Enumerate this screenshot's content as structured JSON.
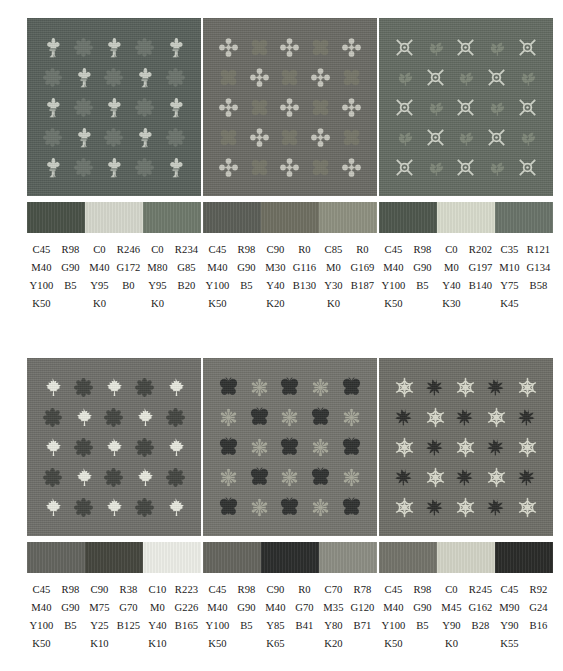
{
  "page": {
    "kind": "textile-color-swatch-sheet",
    "background": "#ffffff"
  },
  "blocks": [
    {
      "id": "block-1",
      "position": "top-left",
      "fabric": {
        "background": "#57605a",
        "motif_a": {
          "name": "fleur-de-lis-icon",
          "color": "#c9cdc4"
        },
        "motif_b": {
          "name": "flower-rosette-icon",
          "color": "#6b736c"
        }
      },
      "bar": [
        "#4a5248",
        "#d5d7cc",
        "#6f7a6c"
      ],
      "columns": [
        {
          "cmyk": [
            "C45",
            "M40",
            "Y100",
            "K50"
          ],
          "rgb": [
            "R98",
            "G90",
            "B5"
          ]
        },
        {
          "cmyk": [
            "C0",
            "M40",
            "Y95",
            "K0"
          ],
          "rgb": [
            "R246",
            "G172",
            "B0"
          ]
        },
        {
          "cmyk": [
            "C0",
            "M80",
            "Y95",
            "K0"
          ],
          "rgb": [
            "R234",
            "G85",
            "B20"
          ]
        }
      ]
    },
    {
      "id": "block-2",
      "position": "top-middle",
      "fabric": {
        "background": "#6a6a64",
        "motif_a": {
          "name": "cross-clover-icon",
          "color": "#c6c6bd"
        },
        "motif_b": {
          "name": "quatrefoil-icon",
          "color": "#757568"
        }
      },
      "bar": [
        "#5c5f58",
        "#6f6f62",
        "#8f9181"
      ],
      "columns": [
        {
          "cmyk": [
            "C45",
            "M40",
            "Y100",
            "K50"
          ],
          "rgb": [
            "R98",
            "G90",
            "B5"
          ]
        },
        {
          "cmyk": [
            "C90",
            "M30",
            "Y40",
            "K20"
          ],
          "rgb": [
            "R0",
            "G116",
            "B130"
          ]
        },
        {
          "cmyk": [
            "C85",
            "M0",
            "Y30",
            "K0"
          ],
          "rgb": [
            "R0",
            "G169",
            "B187"
          ]
        }
      ]
    },
    {
      "id": "block-3",
      "position": "top-right",
      "fabric": {
        "background": "#636b62",
        "motif_a": {
          "name": "x-in-circle-icon",
          "color": "#cfd3c8"
        },
        "motif_b": {
          "name": "leaf-sprig-icon",
          "color": "#7e8678"
        }
      },
      "bar": [
        "#4f584e",
        "#d8dbcc",
        "#6a746a"
      ],
      "columns": [
        {
          "cmyk": [
            "C45",
            "M40",
            "Y100",
            "K50"
          ],
          "rgb": [
            "R98",
            "G90",
            "B5"
          ]
        },
        {
          "cmyk": [
            "C0",
            "M0",
            "Y40",
            "K30"
          ],
          "rgb": [
            "R202",
            "G197",
            "B140"
          ]
        },
        {
          "cmyk": [
            "C35",
            "M10",
            "Y75",
            "K45"
          ],
          "rgb": [
            "R121",
            "G134",
            "B58"
          ]
        }
      ]
    },
    {
      "id": "block-4",
      "position": "bottom-left",
      "fabric": {
        "background": "#6f6f6a",
        "motif_a": {
          "name": "maple-leaf-icon",
          "color": "#e8e9df"
        },
        "motif_b": {
          "name": "flower-rosette-icon",
          "color": "#434541"
        }
      },
      "bar": [
        "#64655f",
        "#46473f",
        "#ecede7"
      ],
      "columns": [
        {
          "cmyk": [
            "C45",
            "M40",
            "Y100",
            "K50"
          ],
          "rgb": [
            "R98",
            "G90",
            "B5"
          ]
        },
        {
          "cmyk": [
            "C90",
            "M75",
            "Y25",
            "K10"
          ],
          "rgb": [
            "R38",
            "G70",
            "B125"
          ]
        },
        {
          "cmyk": [
            "C10",
            "M0",
            "Y40",
            "K10"
          ],
          "rgb": [
            "R223",
            "G226",
            "B165"
          ]
        }
      ]
    },
    {
      "id": "block-5",
      "position": "bottom-middle",
      "fabric": {
        "background": "#74746e",
        "motif_a": {
          "name": "butterfly-icon",
          "color": "#2f3130"
        },
        "motif_b": {
          "name": "star-flower-icon",
          "color": "#a7a89a"
        }
      },
      "bar": [
        "#66665f",
        "#2c2e2d",
        "#8d8e84"
      ],
      "columns": [
        {
          "cmyk": [
            "C45",
            "M40",
            "Y100",
            "K50"
          ],
          "rgb": [
            "R98",
            "G90",
            "B5"
          ]
        },
        {
          "cmyk": [
            "C90",
            "M40",
            "Y85",
            "K65"
          ],
          "rgb": [
            "R0",
            "G70",
            "B41"
          ]
        },
        {
          "cmyk": [
            "C70",
            "M35",
            "Y80",
            "K20"
          ],
          "rgb": [
            "R78",
            "G120",
            "B71"
          ]
        }
      ]
    },
    {
      "id": "block-6",
      "position": "bottom-right",
      "fabric": {
        "background": "#6e6e67",
        "motif_a": {
          "name": "snowflake-icon",
          "color": "#d9dacd"
        },
        "motif_b": {
          "name": "maple-leaf-dark-icon",
          "color": "#2c2d2b"
        }
      },
      "bar": [
        "#74746b",
        "#d2d3c6",
        "#2b2c2a"
      ],
      "columns": [
        {
          "cmyk": [
            "C45",
            "M40",
            "Y100",
            "K50"
          ],
          "rgb": [
            "R98",
            "G90",
            "B5"
          ]
        },
        {
          "cmyk": [
            "C0",
            "M45",
            "Y90",
            "K0"
          ],
          "rgb": [
            "R245",
            "G162",
            "B28"
          ]
        },
        {
          "cmyk": [
            "C45",
            "M90",
            "Y90",
            "K55"
          ],
          "rgb": [
            "R92",
            "G24",
            "B16"
          ]
        }
      ]
    }
  ]
}
